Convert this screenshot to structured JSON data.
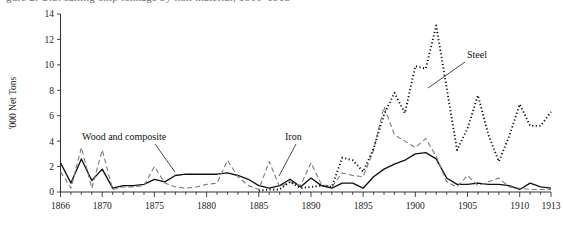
{
  "figure": {
    "cut_title_fragment": "gure 2.  U.S. sailing-ship tonnage by hull material, 1866–1913"
  },
  "chart_data": {
    "type": "line",
    "title": "",
    "xlabel": "",
    "ylabel": "'000 Net Tons",
    "xlim": [
      1866,
      1913
    ],
    "ylim": [
      0,
      14
    ],
    "grid": false,
    "legend_position": "inline-annotations",
    "xticks": [
      1866,
      1870,
      1875,
      1880,
      1885,
      1890,
      1895,
      1900,
      1905,
      1910,
      1913
    ],
    "xtick_labels": [
      "1866",
      "1870",
      "1875",
      "1880",
      "1885",
      "1890",
      "1895",
      "1900",
      "1905",
      "1910",
      "1913"
    ],
    "yticks": [
      0,
      2,
      4,
      6,
      8,
      10,
      12,
      14
    ],
    "ytick_labels": [
      "0",
      "2",
      "4",
      "6",
      "8",
      "10",
      "12",
      "14"
    ],
    "minor_xtick_interval": 1,
    "x": [
      1866,
      1867,
      1868,
      1869,
      1870,
      1871,
      1872,
      1873,
      1874,
      1875,
      1876,
      1877,
      1878,
      1879,
      1880,
      1881,
      1882,
      1883,
      1884,
      1885,
      1886,
      1887,
      1888,
      1889,
      1890,
      1891,
      1892,
      1893,
      1894,
      1895,
      1896,
      1897,
      1898,
      1899,
      1900,
      1901,
      1902,
      1903,
      1904,
      1905,
      1906,
      1907,
      1908,
      1909,
      1910,
      1911,
      1912,
      1913
    ],
    "series": [
      {
        "name": "Wood and composite",
        "style": "solid",
        "color": "#111111",
        "values": [
          2.3,
          0.7,
          2.6,
          0.9,
          1.8,
          0.3,
          0.5,
          0.5,
          0.6,
          1.0,
          0.8,
          1.3,
          1.4,
          1.4,
          1.4,
          1.4,
          1.5,
          1.3,
          1.0,
          0.5,
          0.3,
          0.5,
          1.0,
          0.4,
          1.1,
          0.5,
          0.3,
          0.7,
          0.7,
          0.3,
          1.2,
          1.8,
          2.2,
          2.5,
          3.0,
          3.1,
          2.6,
          1.1,
          0.6,
          0.6,
          0.7,
          0.6,
          0.6,
          0.5,
          0.2,
          0.7,
          0.4,
          0.3
        ]
      },
      {
        "name": "Iron",
        "style": "dashed",
        "color": "#7a7a7a",
        "values": [
          1.6,
          0.3,
          3.5,
          0.3,
          3.3,
          0.2,
          0.4,
          0.4,
          0.5,
          2.0,
          0.7,
          0.4,
          0.3,
          0.4,
          0.6,
          0.7,
          2.5,
          1.2,
          0.5,
          0.2,
          2.4,
          0.4,
          0.8,
          0.5,
          2.3,
          0.6,
          0.4,
          1.5,
          1.3,
          1.2,
          3.3,
          6.7,
          4.5,
          4.0,
          3.5,
          4.2,
          2.8,
          0.8,
          0.4,
          1.3,
          0.5,
          0.8,
          1.1,
          0.4,
          0.3,
          0.2,
          0.2,
          0.2
        ]
      },
      {
        "name": "Steel",
        "style": "dotted",
        "color": "#111111",
        "values": [
          0,
          0,
          0,
          0,
          0,
          0,
          0,
          0,
          0,
          0,
          0,
          0,
          0,
          0,
          0,
          0,
          0,
          0,
          0,
          0.1,
          0.2,
          0.2,
          0.8,
          0.3,
          0.4,
          0.5,
          0.4,
          2.7,
          2.5,
          1.6,
          3.4,
          6.1,
          7.8,
          6.2,
          9.9,
          9.7,
          13.1,
          8.2,
          3.3,
          5.0,
          7.6,
          4.5,
          2.4,
          4.4,
          6.9,
          5.2,
          5.2,
          6.3
        ]
      }
    ],
    "annotations": [
      {
        "text": "Wood and composite",
        "label_x": 82,
        "label_y": 140,
        "leader_from_x": 155,
        "leader_from_y": 144,
        "leader_to_x": 175,
        "leader_to_y": 172,
        "target_series": "Wood and composite"
      },
      {
        "text": "Iron",
        "label_x": 285,
        "label_y": 140,
        "leader_from_x": 296,
        "leader_from_y": 144,
        "leader_to_x": 279,
        "leader_to_y": 176,
        "target_series": "Iron"
      },
      {
        "text": "Steel",
        "label_x": 467,
        "label_y": 58,
        "leader_from_x": 465,
        "leader_from_y": 62,
        "leader_to_x": 428,
        "leader_to_y": 88,
        "target_series": "Steel"
      }
    ]
  }
}
